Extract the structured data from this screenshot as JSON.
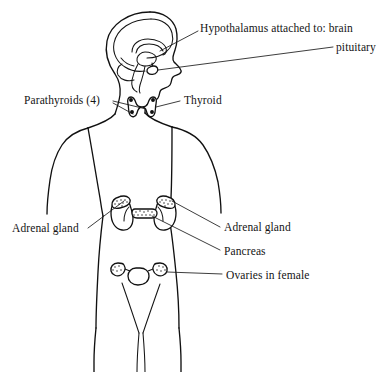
{
  "figure": {
    "background_color": "#ffffff",
    "ink_color": "#111111"
  },
  "labels": {
    "hypothalamus": "Hypothalamus attached to: brain",
    "pituitary": "pituitary",
    "parathyroids": "Parathyroids (4)",
    "thyroid": "Thyroid",
    "adrenal_left": "Adrenal gland",
    "adrenal_right": "Adrenal gland",
    "pancreas": "Pancreas",
    "ovaries": "Ovaries in female"
  },
  "organs": [
    {
      "name": "brain",
      "label_key": "hypothalamus"
    },
    {
      "name": "pituitary-gland",
      "label_key": "pituitary"
    },
    {
      "name": "thyroid-gland",
      "label_key": "thyroid"
    },
    {
      "name": "parathyroid-glands",
      "label_key": "parathyroids"
    },
    {
      "name": "adrenal-gland-left",
      "label_key": "adrenal_left"
    },
    {
      "name": "adrenal-gland-right",
      "label_key": "adrenal_right"
    },
    {
      "name": "pancreas",
      "label_key": "pancreas"
    },
    {
      "name": "ovaries",
      "label_key": "ovaries"
    }
  ]
}
